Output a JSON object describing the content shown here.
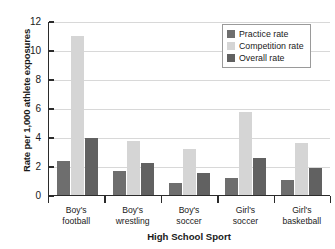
{
  "chart_data": {
    "type": "bar",
    "title": "",
    "xlabel": "High School Sport",
    "ylabel": "Rate per 1,000 athlete exposures",
    "categories": [
      "Boy's football",
      "Boy's wrestling",
      "Boy's soccer",
      "Girl's soccer",
      "Girl's basketball"
    ],
    "category_lines": [
      [
        "Boy's",
        "football"
      ],
      [
        "Boy's",
        "wrestling"
      ],
      [
        "Boy's",
        "soccer"
      ],
      [
        "Girl's",
        "soccer"
      ],
      [
        "Girl's",
        "basketball"
      ]
    ],
    "series": [
      {
        "name": "Practice rate",
        "color": "#6e6e6e",
        "values": [
          2.35,
          1.65,
          0.8,
          1.15,
          1.05
        ]
      },
      {
        "name": "Competition rate",
        "color": "#d5d5d5",
        "values": [
          11.0,
          3.7,
          3.2,
          5.7,
          3.6
        ]
      },
      {
        "name": "Overall rate",
        "color": "#616161",
        "values": [
          3.9,
          2.2,
          1.5,
          2.55,
          1.85
        ]
      }
    ],
    "ylim": [
      0,
      12
    ],
    "yticks": [
      0,
      2,
      4,
      6,
      8,
      10,
      12
    ],
    "ytick_labels": [
      "0",
      "2",
      "4",
      "6",
      "8",
      "10",
      "12"
    ],
    "grid": true,
    "legend_position": "top-right",
    "legend_entries": [
      "Practice rate",
      "Competition rate",
      "Overall rate"
    ]
  }
}
